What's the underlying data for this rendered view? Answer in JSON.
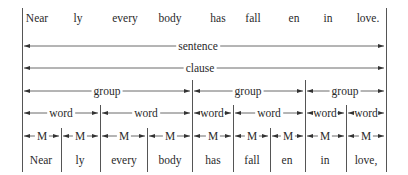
{
  "top_row": {
    "words": [
      {
        "text": "Near",
        "x": 37
      },
      {
        "text": "ly",
        "x": 78
      },
      {
        "text": "every",
        "x": 125
      },
      {
        "text": "body",
        "x": 170
      },
      {
        "text": "has",
        "x": 218
      },
      {
        "text": "fall",
        "x": 253
      },
      {
        "text": "en",
        "x": 294
      },
      {
        "text": "in",
        "x": 328
      },
      {
        "text": "love.",
        "x": 368
      }
    ]
  },
  "levels": {
    "sentence": {
      "label": "sentence",
      "y": 46
    },
    "clause": {
      "label": "clause",
      "y": 68
    },
    "group": {
      "label": "group",
      "y": 91,
      "spans": [
        {
          "x1": 22,
          "x2": 192,
          "label": "group"
        },
        {
          "x1": 192,
          "x2": 305,
          "label": "group"
        },
        {
          "x1": 305,
          "x2": 386,
          "label": "group"
        }
      ]
    },
    "word": {
      "label": "word",
      "y": 113,
      "spans": [
        {
          "x1": 22,
          "x2": 100,
          "label": "word"
        },
        {
          "x1": 100,
          "x2": 192,
          "label": "word"
        },
        {
          "x1": 192,
          "x2": 233,
          "label": "word"
        },
        {
          "x1": 233,
          "x2": 305,
          "label": "word"
        },
        {
          "x1": 305,
          "x2": 346,
          "label": "word"
        },
        {
          "x1": 346,
          "x2": 386,
          "label": "word"
        }
      ]
    },
    "morpheme": {
      "label": "M",
      "y": 136,
      "spans": [
        {
          "x1": 22,
          "x2": 61,
          "label": "M"
        },
        {
          "x1": 61,
          "x2": 100,
          "label": "M"
        },
        {
          "x1": 100,
          "x2": 147,
          "label": "M"
        },
        {
          "x1": 147,
          "x2": 192,
          "label": "M"
        },
        {
          "x1": 192,
          "x2": 233,
          "label": "M"
        },
        {
          "x1": 233,
          "x2": 270,
          "label": "M"
        },
        {
          "x1": 270,
          "x2": 305,
          "label": "M"
        },
        {
          "x1": 305,
          "x2": 346,
          "label": "M"
        },
        {
          "x1": 346,
          "x2": 386,
          "label": "M"
        }
      ]
    }
  },
  "bottom_row": {
    "words": [
      {
        "text": "Near",
        "x": 41
      },
      {
        "text": "ly",
        "x": 80
      },
      {
        "text": "every",
        "x": 124
      },
      {
        "text": "body",
        "x": 170
      },
      {
        "text": "has",
        "x": 213
      },
      {
        "text": "fall",
        "x": 252
      },
      {
        "text": "en",
        "x": 287
      },
      {
        "text": "in",
        "x": 325
      },
      {
        "text": "love,",
        "x": 366
      }
    ]
  },
  "colors": {
    "ink": "#2a2a2a",
    "line": "#555555"
  }
}
